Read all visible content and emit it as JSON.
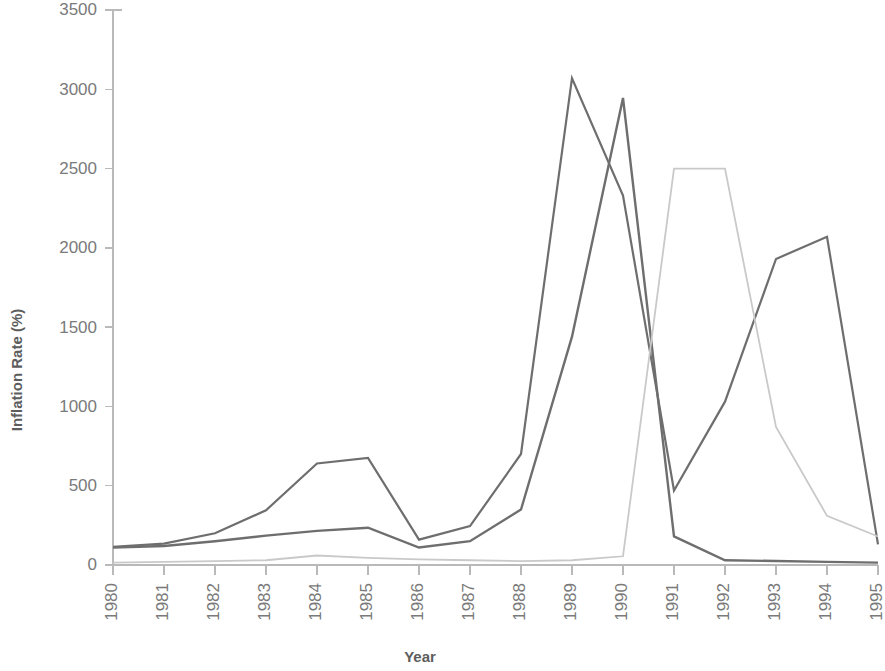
{
  "chart_data": {
    "type": "line",
    "title": "",
    "xlabel": "Year",
    "ylabel": "Inflation Rate (%)",
    "categories": [
      "1980",
      "1981",
      "1982",
      "1983",
      "1984",
      "1985",
      "1986",
      "1987",
      "1988",
      "1989",
      "1990",
      "1991",
      "1992",
      "1993",
      "1994",
      "1995"
    ],
    "x": [
      1980,
      1981,
      1982,
      1983,
      1984,
      1985,
      1986,
      1987,
      1988,
      1989,
      1990,
      1991,
      1992,
      1993,
      1994,
      1995
    ],
    "ylim": [
      0,
      3500
    ],
    "xlim": [
      1980,
      1995
    ],
    "yticks": [
      0,
      500,
      1000,
      1500,
      2000,
      2500,
      3000,
      3500
    ],
    "ytick_labels": [
      "0",
      "500",
      "1000",
      "1500",
      "2000",
      "2500",
      "3000",
      "3500"
    ],
    "grid": false,
    "legend": "none",
    "series": [
      {
        "name": "series-1",
        "color": "#6e6e6e",
        "width": 2.2,
        "values": [
          115,
          135,
          200,
          345,
          640,
          675,
          160,
          245,
          700,
          3070,
          2330,
          470,
          1030,
          1930,
          2070,
          130
        ]
      },
      {
        "name": "series-2",
        "color": "#6e6e6e",
        "width": 2.4,
        "values": [
          110,
          120,
          150,
          185,
          215,
          235,
          110,
          150,
          350,
          1440,
          2945,
          180,
          30,
          25,
          20,
          15
        ]
      },
      {
        "name": "series-3",
        "color": "#c9c9c9",
        "width": 1.8,
        "values": [
          15,
          20,
          25,
          30,
          60,
          45,
          35,
          30,
          25,
          30,
          55,
          2500,
          2500,
          870,
          310,
          180
        ]
      }
    ]
  },
  "axes": {
    "x_title": "Year",
    "y_title": "Inflation Rate (%)"
  },
  "colors": {
    "axis": "#b9b9b9",
    "tick_text": "#7a7a7a",
    "title_text": "#5d5d5d",
    "series_dark": "#6e6e6e",
    "series_light": "#c9c9c9",
    "background": "#ffffff"
  }
}
